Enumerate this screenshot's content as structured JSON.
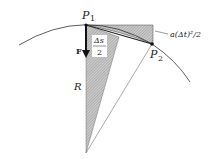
{
  "diagram": {
    "type": "geometry-physics",
    "labels": {
      "p1": "P",
      "p1_sub": "1",
      "p2": "P",
      "p2_sub": "2",
      "force": "F",
      "radius": "R",
      "arc_half_num": "Δs",
      "arc_half_den": "2",
      "displacement": "a(Δt)²/2"
    },
    "points": {
      "P1": [
        86,
        25
      ],
      "P2": [
        152,
        44
      ],
      "center": [
        86,
        153
      ],
      "arc_start": [
        19,
        45
      ],
      "arc_end": [
        190,
        82
      ]
    },
    "colors": {
      "stroke": "#222222",
      "hatch_fill": "#b8b8b8",
      "background": "#ffffff"
    }
  }
}
